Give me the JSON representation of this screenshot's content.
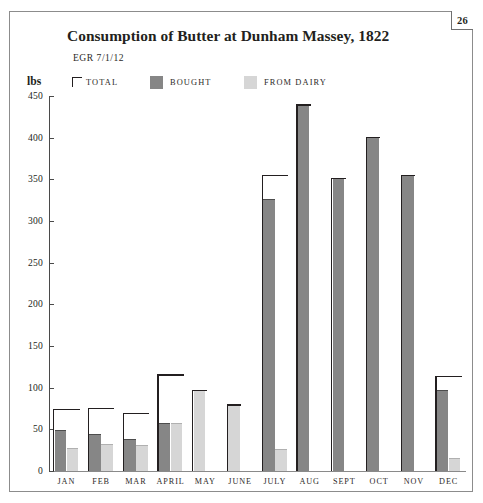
{
  "folio": {
    "page_number": "26"
  },
  "header": {
    "title": "Consumption of Butter at Dunham Massey, 1822",
    "subtitle": "EGR 7/1/12",
    "unit_label": "lbs"
  },
  "legend": {
    "items": [
      {
        "label": "TOTAL",
        "marker": "bracket",
        "color": "#231f20"
      },
      {
        "label": "BOUGHT",
        "marker": "swatch",
        "color": "#868686"
      },
      {
        "label": "FROM DAIRY",
        "marker": "swatch",
        "color": "#d6d6d6"
      }
    ]
  },
  "axes": {
    "y_ticks": [
      "450",
      "400",
      "350",
      "300",
      "250",
      "200",
      "150",
      "100",
      "50",
      "0"
    ],
    "x_labels": [
      "JAN",
      "FEB",
      "MAR",
      "APRIL",
      "MAY",
      "JUNE",
      "JULY",
      "AUG",
      "SEPT",
      "OCT",
      "NOV",
      "DEC"
    ]
  },
  "chart_data": {
    "type": "bar",
    "title": "Consumption of Butter at Dunham Massey, 1822",
    "subtitle": "EGR 7/1/12",
    "xlabel": "",
    "ylabel": "lbs",
    "ylim": [
      0,
      450
    ],
    "ytick_step": 50,
    "grid": false,
    "legend_position": "top",
    "categories": [
      "JAN",
      "FEB",
      "MAR",
      "APRIL",
      "MAY",
      "JUNE",
      "JULY",
      "AUG",
      "SEPT",
      "OCT",
      "NOV",
      "DEC"
    ],
    "series": [
      {
        "name": "BOUGHT",
        "color": "#868686",
        "values": [
          49,
          44,
          38,
          58,
          0,
          0,
          327,
          440,
          352,
          401,
          355,
          97
        ]
      },
      {
        "name": "FROM DAIRY",
        "color": "#d6d6d6",
        "values": [
          28,
          32,
          31,
          58,
          97,
          80,
          27,
          0,
          0,
          0,
          0,
          16
        ]
      },
      {
        "name": "TOTAL",
        "color": "#231f20",
        "marker": "bracket",
        "values": [
          75,
          76,
          70,
          116,
          97,
          80,
          355,
          440,
          352,
          401,
          355,
          114
        ]
      }
    ]
  }
}
